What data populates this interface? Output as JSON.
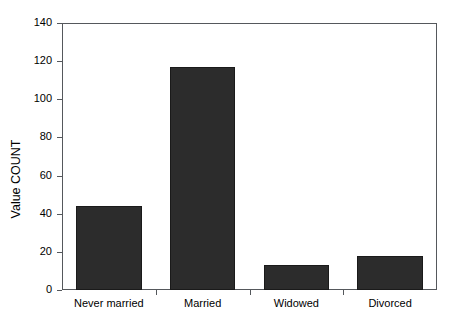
{
  "chart_data": {
    "type": "bar",
    "title": "",
    "xlabel": "",
    "ylabel": "Value COUNT",
    "categories": [
      "Never married",
      "Married",
      "Widowed",
      "Divorced"
    ],
    "values": [
      44,
      117,
      13,
      18
    ],
    "ylim": [
      0,
      140
    ],
    "yticks": [
      0,
      20,
      40,
      60,
      80,
      100,
      120,
      140
    ],
    "ytick_labels": [
      "0",
      "20",
      "40",
      "60",
      "80",
      "100",
      "120",
      "140"
    ],
    "grid": false,
    "legend": "none",
    "bar_color": "#2c2c2c",
    "axis_color": "#55585c",
    "background": "#ffffff"
  }
}
